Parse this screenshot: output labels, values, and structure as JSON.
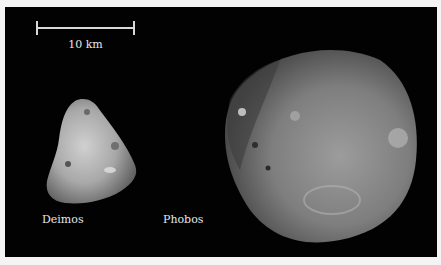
{
  "scale_bar": {
    "label": "10 km"
  },
  "moons": [
    {
      "name": "Deimos"
    },
    {
      "name": "Phobos"
    }
  ],
  "colors": {
    "background": "#020202",
    "border": "#f4f4f4",
    "text": "#e6e6e6"
  }
}
